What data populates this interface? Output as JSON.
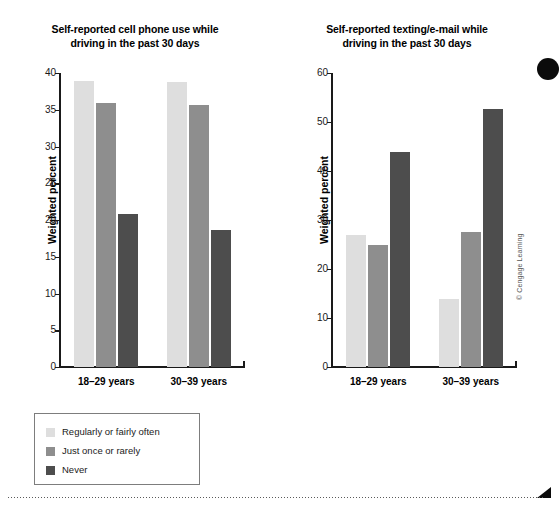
{
  "chart_data": [
    {
      "type": "bar",
      "id": "cell-phone-use",
      "title": "Self-reported cell phone use while driving in the past 30 days",
      "title_lines": [
        "Self-reported cell phone use while",
        "driving in the past 30 days"
      ],
      "xlabel": "",
      "ylabel": "Weighted percent",
      "ylim": [
        0,
        40
      ],
      "yticks": [
        0,
        5,
        10,
        15,
        20,
        25,
        30,
        35,
        40
      ],
      "ytick_labels": [
        "0",
        "5",
        "10",
        "15",
        "20",
        "25",
        "30",
        "35",
        "40"
      ],
      "grid": false,
      "legend_position": "below-left",
      "categories": [
        "18–29 years",
        "30–39 years"
      ],
      "series": [
        {
          "name": "Regularly or fairly often",
          "color": "#dedede",
          "values": [
            38.9,
            38.8
          ]
        },
        {
          "name": "Just once or rarely",
          "color": "#8e8e8e",
          "values": [
            35.9,
            35.7
          ]
        },
        {
          "name": "Never",
          "color": "#4d4d4d",
          "values": [
            20.8,
            18.7
          ]
        }
      ]
    },
    {
      "type": "bar",
      "id": "texting-email",
      "title": "Self-reported texting/e-mail while driving in the past 30 days",
      "title_lines": [
        "Self-reported texting/e-mail while",
        "driving in the past 30 days"
      ],
      "xlabel": "",
      "ylabel": "Weighted percent",
      "ylim": [
        0,
        60
      ],
      "yticks": [
        0,
        10,
        20,
        30,
        40,
        50,
        60
      ],
      "ytick_labels": [
        "0",
        "10",
        "20",
        "30",
        "40",
        "50",
        "60"
      ],
      "grid": false,
      "legend_position": "shared",
      "categories": [
        "18–29 years",
        "30–39 years"
      ],
      "series": [
        {
          "name": "Regularly or fairly often",
          "color": "#dedede",
          "values": [
            26.9,
            13.8
          ]
        },
        {
          "name": "Just once or rarely",
          "color": "#8e8e8e",
          "values": [
            24.8,
            27.6
          ]
        },
        {
          "name": "Never",
          "color": "#4d4d4d",
          "values": [
            43.9,
            52.6
          ]
        }
      ]
    }
  ],
  "legend": {
    "items": [
      {
        "label": "Regularly or fairly often",
        "color": "#dedede"
      },
      {
        "label": "Just once or rarely",
        "color": "#8e8e8e"
      },
      {
        "label": "Never",
        "color": "#4d4d4d"
      }
    ]
  },
  "credit": "© Cengage Learning",
  "colors": {
    "regularly": "#dedede",
    "just_once": "#8e8e8e",
    "never": "#4d4d4d",
    "axis": "#1a1a1a",
    "legend_border": "#7d7d7d"
  }
}
